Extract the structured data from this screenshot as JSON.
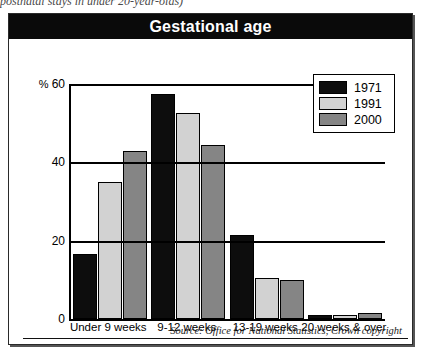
{
  "top_caption": "postnatal stays in under 20-year-olds)",
  "figure": {
    "title": "Gestational age",
    "source_note": "Source: Office for National Statistics, Crown copyright"
  },
  "legend": {
    "position": "top-right",
    "entries": [
      {
        "label": "1971",
        "color": "#0d0d0d"
      },
      {
        "label": "1991",
        "color": "#d2d2d2"
      },
      {
        "label": "2000",
        "color": "#858585"
      }
    ]
  },
  "axis": {
    "y_unit": "%",
    "ticks": [
      "60",
      "40",
      "20",
      "0"
    ]
  },
  "chart_data": {
    "type": "bar",
    "title": "Gestational age",
    "xlabel": "",
    "ylabel": "%",
    "ylim": [
      0,
      60
    ],
    "yticks": [
      0,
      20,
      40,
      60
    ],
    "grid": true,
    "legend_position": "top-right",
    "categories": [
      "Under 9 weeks",
      "9-12 weeks",
      "13-19 weeks",
      "20 weeks & over"
    ],
    "series": [
      {
        "name": "1971",
        "color": "#0d0d0d",
        "values": [
          16.5,
          57.5,
          21.5,
          1.0
        ]
      },
      {
        "name": "1991",
        "color": "#d2d2d2",
        "values": [
          35.0,
          52.5,
          10.5,
          1.0
        ]
      },
      {
        "name": "2000",
        "color": "#858585",
        "values": [
          43.0,
          44.5,
          10.0,
          1.5
        ]
      }
    ],
    "annotations": [
      "Source: Office for National Statistics, Crown copyright"
    ]
  }
}
